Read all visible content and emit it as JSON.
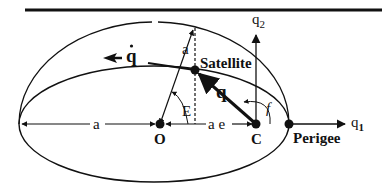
{
  "diagram": {
    "colors": {
      "ink": "#111111",
      "background": "#ffffff"
    },
    "labels": {
      "q1_axis": "q",
      "q1_sub": "1",
      "q2_axis": "q",
      "q2_sub": "2",
      "q_dot": "q",
      "q_vector": "q",
      "a_upper": "a",
      "a_left": "a",
      "ae": "a e",
      "E": "E",
      "f": "f",
      "O": "O",
      "C": "C",
      "satellite": "Satellite",
      "perigee": "Perigee"
    },
    "points": [
      {
        "name": "O",
        "role": "ellipse center"
      },
      {
        "name": "C",
        "role": "focus / Earth center"
      },
      {
        "name": "Satellite",
        "role": "satellite position on orbit"
      },
      {
        "name": "Perigee",
        "role": "closest orbit point"
      }
    ],
    "angles": [
      {
        "name": "E",
        "meaning": "eccentric anomaly"
      },
      {
        "name": "f",
        "meaning": "true anomaly"
      }
    ],
    "distances": [
      {
        "name": "a",
        "meaning": "semi-major axis"
      },
      {
        "name": "a e",
        "meaning": "center-to-focus distance"
      }
    ]
  }
}
